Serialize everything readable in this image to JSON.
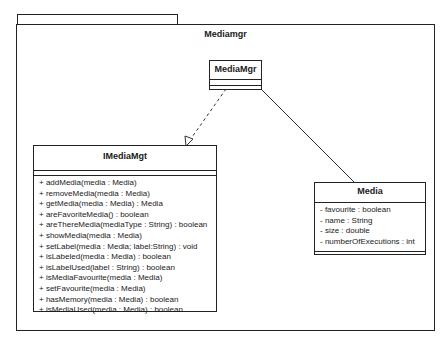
{
  "package": {
    "name": "Mediamgr"
  },
  "classes": {
    "mediamgr": {
      "name": "MediaMgr",
      "attributes": [],
      "operations": []
    },
    "imediamgt": {
      "name": "IMediaMgt",
      "attributes": [],
      "operations": [
        "+ addMedia(media : Media)",
        "+ removeMedia(media : Media)",
        "+ getMedia(media : Media) : Media",
        "+ areFavoriteMedia() : boolean",
        "+ areThereMedia(mediaType : String) : boolean",
        "+ showMedia(media : Media)",
        "+ setLabel(media : Media; label:String) : void",
        "+ isLabeled(media : Media) : boolean",
        "+ isLabelUsed(label : String) : boolean",
        "+ isMediaFavourite(media : Media)",
        "+ setFavourite(media : Media)",
        "+ hasMemory(media : Media) : boolean",
        "+ isMediaUsed(media : Media) : boolean"
      ]
    },
    "media": {
      "name": "Media",
      "attributes": [
        "- favourite : boolean",
        "- name : String",
        "- size : double",
        "- numberOfExecutions : int"
      ],
      "operations": []
    }
  },
  "relationships": [
    {
      "from": "MediaMgr",
      "to": "IMediaMgt",
      "type": "realization"
    },
    {
      "from": "MediaMgr",
      "to": "Media",
      "type": "association"
    }
  ]
}
